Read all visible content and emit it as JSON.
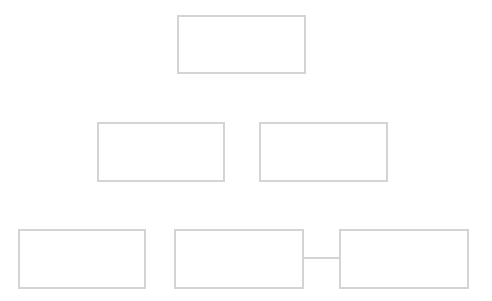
{
  "diagram": {
    "type": "org-chart",
    "border_color": "#d4d4d4",
    "background": "#ffffff",
    "nodes": [
      {
        "id": "n1",
        "label": "",
        "x": 177,
        "y": 15,
        "w": 129,
        "h": 59
      },
      {
        "id": "n2",
        "label": "",
        "x": 97,
        "y": 122,
        "w": 128,
        "h": 60
      },
      {
        "id": "n3",
        "label": "",
        "x": 259,
        "y": 122,
        "w": 129,
        "h": 60
      },
      {
        "id": "n4",
        "label": "",
        "x": 18,
        "y": 229,
        "w": 128,
        "h": 60
      },
      {
        "id": "n5",
        "label": "",
        "x": 174,
        "y": 229,
        "w": 130,
        "h": 60
      },
      {
        "id": "n6",
        "label": "",
        "x": 339,
        "y": 229,
        "w": 130,
        "h": 60
      }
    ],
    "edges": [
      {
        "from": "n5",
        "to": "n6"
      }
    ]
  }
}
